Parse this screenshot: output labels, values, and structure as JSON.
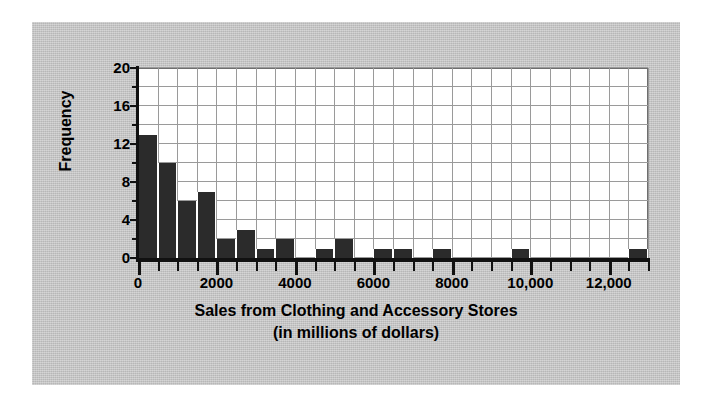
{
  "chart_data": {
    "type": "bar",
    "title": "",
    "xlabel": "Sales from Clothing and Accessory Stores",
    "xlabel_line2": "(in millions of dollars)",
    "ylabel": "Frequency",
    "xlim": [
      0,
      13000
    ],
    "ylim": [
      0,
      20
    ],
    "bin_width": 500,
    "grid": true,
    "legend": false,
    "x_tick_labels": [
      "0",
      "2000",
      "4000",
      "6000",
      "8000",
      "10,000",
      "12,000"
    ],
    "x_tick_values": [
      0,
      2000,
      4000,
      6000,
      8000,
      10000,
      12000
    ],
    "x_minor_tick_step": 500,
    "y_tick_labels": [
      "0",
      "4",
      "8",
      "12",
      "16",
      "20"
    ],
    "y_tick_values": [
      0,
      4,
      8,
      12,
      16,
      20
    ],
    "y_minor_tick_step": 2,
    "bin_starts": [
      0,
      500,
      1000,
      1500,
      2000,
      2500,
      3000,
      3500,
      4000,
      4500,
      5000,
      5500,
      6000,
      6500,
      7000,
      7500,
      8000,
      8500,
      9000,
      9500,
      10000,
      10500,
      11000,
      11500,
      12000,
      12500
    ],
    "categories": [
      "0-500",
      "500-1000",
      "1000-1500",
      "1500-2000",
      "2000-2500",
      "2500-3000",
      "3000-3500",
      "3500-4000",
      "4000-4500",
      "4500-5000",
      "5000-5500",
      "5500-6000",
      "6000-6500",
      "6500-7000",
      "7000-7500",
      "7500-8000",
      "8000-8500",
      "8500-9000",
      "9000-9500",
      "9500-10000",
      "10000-10500",
      "10500-11000",
      "11000-11500",
      "11500-12000",
      "12000-12500",
      "12500-13000"
    ],
    "values": [
      13,
      10,
      6,
      7,
      2,
      3,
      1,
      2,
      0,
      1,
      2,
      0,
      1,
      1,
      0,
      1,
      0,
      0,
      0,
      1,
      0,
      0,
      0,
      0,
      0,
      1
    ],
    "bar_color": "#2b2b2b",
    "plot_background": "#ffffff",
    "figure_background": "#c8c8c8",
    "grid_color": "#9a9a9a",
    "axis_color": "#111111"
  }
}
